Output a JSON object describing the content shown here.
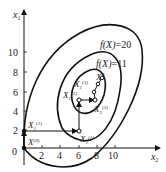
{
  "diagram": {
    "type": "contour-optimization-path",
    "axes": {
      "x_label": "x",
      "x_label_sub": "2",
      "y_label": "x",
      "y_label_sub": "1",
      "x_ticks": [
        "2",
        "4",
        "6",
        "8",
        "10"
      ],
      "y_ticks": [
        "2",
        "4",
        "6",
        "8",
        "10"
      ],
      "origin_label": "0"
    },
    "contours": [
      {
        "label_f": "f",
        "label_arg": "(X)",
        "label_val": "=20"
      },
      {
        "label_f": "f",
        "label_arg": "(X)",
        "label_val": "=11"
      }
    ],
    "points": {
      "x0": {
        "base": "X",
        "sup": "(0)"
      },
      "x1_1": {
        "base": "X",
        "sub": "1",
        "sup": "(1)"
      },
      "x2_1": {
        "base": "X",
        "sub": "2",
        "sup": "(1)"
      },
      "x1_2": {
        "base": "X",
        "sub": "1",
        "sup": "(2)"
      },
      "x2_2": {
        "base": "X",
        "sub": "2",
        "sup": "(2)"
      },
      "x1_3": {
        "base": "X",
        "sub": "1",
        "sup": "(3)"
      },
      "xstar": {
        "base": "X",
        "sup": "*"
      }
    },
    "colors": {
      "line": "#111111",
      "background": "#ffffff"
    }
  }
}
